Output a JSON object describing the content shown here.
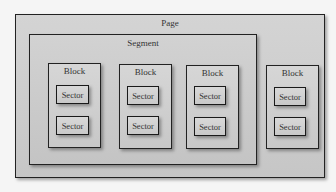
{
  "diagram": {
    "page": {
      "label": "Page"
    },
    "segment": {
      "label": "Segment"
    },
    "blocks": [
      {
        "label": "Block",
        "sectors": [
          {
            "label": "Sector"
          },
          {
            "label": "Sector"
          }
        ]
      },
      {
        "label": "Block",
        "sectors": [
          {
            "label": "Sector"
          },
          {
            "label": "Sector"
          }
        ]
      },
      {
        "label": "Block",
        "sectors": [
          {
            "label": "Sector"
          },
          {
            "label": "Sector"
          }
        ]
      },
      {
        "label": "Block",
        "sectors": [
          {
            "label": "Sector"
          },
          {
            "label": "Sector"
          }
        ]
      }
    ]
  },
  "colors": {
    "background": "#f5f5f5",
    "fill": "#c8c8c8",
    "border": "#222222"
  }
}
